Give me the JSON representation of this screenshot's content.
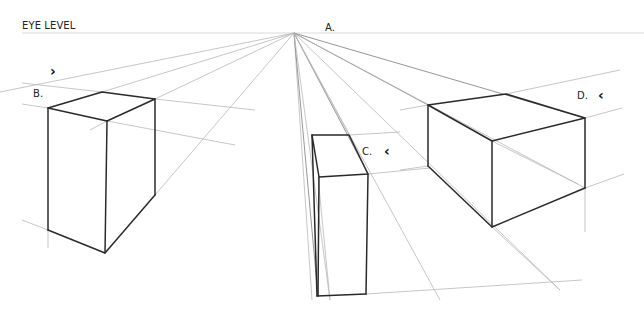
{
  "labels": {
    "eye_level": "EYE LEVEL",
    "a": "A.",
    "b": "B.",
    "c": "C.",
    "d": "D."
  },
  "markers": {
    "b_chevron": "›",
    "c_chevron": "‹",
    "d_chevron": "‹"
  },
  "colors": {
    "edge": "#2a2a2a",
    "guide": "#b8b8b8",
    "background": "#ffffff"
  },
  "vanishing_point": {
    "x": 294,
    "y": 33
  }
}
